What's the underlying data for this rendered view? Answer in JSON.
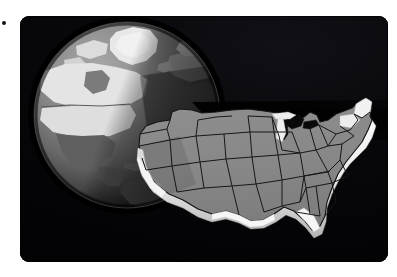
{
  "scene": {
    "title": "United States map over globe",
    "background_color": "#ffffff",
    "panel": {
      "name": "dark-panel",
      "background_color": "#050507",
      "corner_radius_px": 9,
      "x": 20,
      "y": 16,
      "width": 368,
      "height": 246
    },
    "speck": {
      "x": 2,
      "y": 21,
      "size": 4,
      "color": "#151515"
    }
  },
  "globe": {
    "label": "Earth globe",
    "center_x": 127,
    "center_y": 115,
    "radius": 93,
    "ocean_color": "#6e6e6e",
    "ocean_dark_color": "#4a4a4a",
    "land_light_color": "#e2e2e2",
    "land_mid_color": "#b9b9b9",
    "land_dark_color": "#575757",
    "highlight_color": "#efefef",
    "limb_shadow_color": "#1b1b1b",
    "terminator_color": "#2a2a2a",
    "features": [
      "Greenland",
      "Canada",
      "United States",
      "Mexico",
      "Central America",
      "South America",
      "North Atlantic Ocean",
      "Europe",
      "Africa"
    ]
  },
  "map": {
    "label": "Contiguous United States",
    "fill_color": "#8a8a8a",
    "fill_shaded_color": "#6f6f6f",
    "border_color": "#1a1a1a",
    "extrusion_color": "#f2f2f2",
    "extrusion_shadow_color": "#bdbdbd",
    "lakes_color": "#090909",
    "regions_visible": [
      "Washington",
      "Oregon",
      "California",
      "Nevada",
      "Idaho",
      "Montana",
      "Wyoming",
      "Utah",
      "Arizona",
      "New Mexico",
      "Colorado",
      "North Dakota",
      "South Dakota",
      "Nebraska",
      "Kansas",
      "Oklahoma",
      "Texas",
      "Minnesota",
      "Iowa",
      "Missouri",
      "Arkansas",
      "Louisiana",
      "Wisconsin",
      "Illinois",
      "Michigan",
      "Indiana",
      "Ohio",
      "Kentucky",
      "Tennessee",
      "Mississippi",
      "Alabama",
      "Georgia",
      "Florida",
      "South Carolina",
      "North Carolina",
      "Virginia",
      "West Virginia",
      "Pennsylvania",
      "New York",
      "Maine",
      "New Hampshire",
      "Vermont",
      "Massachusetts"
    ]
  },
  "shadow": {
    "label": "cast shadow wedge",
    "color": "#010102"
  }
}
